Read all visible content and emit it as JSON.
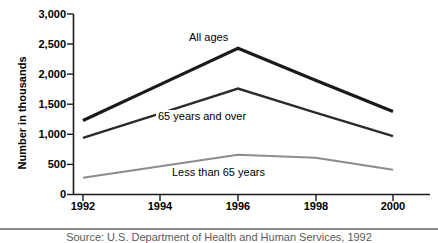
{
  "chart_data": {
    "type": "line",
    "title": "",
    "xlabel": "",
    "ylabel": "Number in thousands",
    "x": [
      1992,
      1994,
      1996,
      1998,
      2000
    ],
    "xtick_labels": [
      "1992",
      "1994",
      "1996",
      "1998",
      "2000"
    ],
    "ytick_labels": [
      "0",
      "500",
      "1,000",
      "1,500",
      "2,000",
      "2,500",
      "3,000"
    ],
    "ytick_values": [
      0,
      500,
      1000,
      1500,
      2000,
      2500,
      3000
    ],
    "ylim": [
      0,
      3000
    ],
    "xlim": [
      1992,
      2000
    ],
    "grid": false,
    "legend_position": "inline-annotations",
    "series": [
      {
        "name": "All ages",
        "values": [
          1230,
          1830,
          2430,
          1900,
          1380
        ],
        "color": "#1a1a1a",
        "line_width": 3.2
      },
      {
        "name": "65 years and over",
        "values": [
          940,
          1350,
          1760,
          1360,
          970
        ],
        "color": "#2b2b2b",
        "line_width": 2.4
      },
      {
        "name": "Less than 65 years",
        "values": [
          280,
          470,
          660,
          610,
          410
        ],
        "color": "#8c8c8c",
        "line_width": 2.0
      }
    ],
    "annotations": [
      {
        "text": "All ages",
        "x": 1995.6,
        "y": 2700
      },
      {
        "text": "65 years and over",
        "x": 1995.4,
        "y": 1430
      },
      {
        "text": "Less than 65 years",
        "x": 1995.8,
        "y": 620
      }
    ]
  },
  "footer": {
    "caption": "Source: U.S. Department of Health and Human Services, 1992"
  }
}
